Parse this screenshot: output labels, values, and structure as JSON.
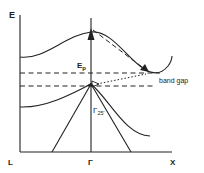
{
  "diagram": {
    "type": "band-structure",
    "axis": {
      "y_label": "E",
      "x_labels": [
        "L",
        "Γ",
        "X"
      ]
    },
    "annotations": {
      "phonon_energy_main": "E",
      "phonon_energy_sub": "p",
      "band_gap": "band gap",
      "gamma_point_main": "Γ",
      "gamma_point_sub": "25'"
    },
    "colors": {
      "line": "#222222",
      "background": "#ffffff"
    }
  }
}
